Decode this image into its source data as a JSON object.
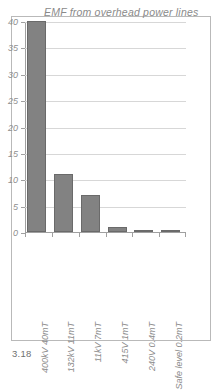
{
  "figure": {
    "caption": "3.18"
  },
  "chart_data": {
    "type": "bar",
    "title": "EMF from overhead power lines",
    "xlabel": "",
    "ylabel": "",
    "categories": [
      "400kV  40mT",
      "132kV  11mT",
      "11kV  7mT",
      "415V  1mT",
      "240V  0.4mT",
      "Safe level  0.2mT"
    ],
    "values": [
      40,
      11,
      7,
      1,
      0.4,
      0.2
    ],
    "ylim": [
      0,
      40
    ],
    "yticks": [
      0,
      5,
      10,
      15,
      20,
      25,
      30,
      35,
      40
    ],
    "ytick_labels": [
      "0",
      "5",
      "10",
      "15",
      "20",
      "25",
      "30",
      "35",
      "40"
    ],
    "grid": true,
    "legend": false,
    "bar_color": "#828282",
    "bar_edge_color": "#6a6a6a",
    "grid_color": "#d7d7d7",
    "axis_color": "#a0a0a0",
    "text_color": "#8a8a8a"
  }
}
